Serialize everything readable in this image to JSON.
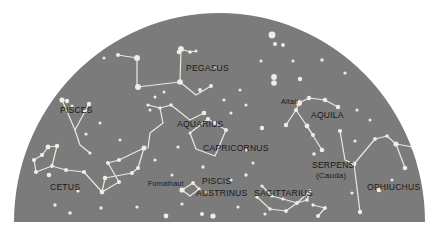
{
  "figure": {
    "kind": "star-chart",
    "projection": "half-dome horizon view",
    "background_color": "#ffffff",
    "sky_color": "#7b7b7b",
    "star_color": "#efeee4",
    "line_color": "#e8e7dd",
    "label_color": "#191919"
  },
  "dome": {
    "left": 14,
    "right": 425,
    "baseline": 222,
    "apex_y": 13
  },
  "chart_data": {
    "type": "scatter",
    "title": "",
    "xlabel": "",
    "ylabel": "",
    "constellation_labels": [
      {
        "name": "PEGASUS",
        "x": 186,
        "y": 71,
        "style": "constellation"
      },
      {
        "name": "PISCES",
        "x": 60,
        "y": 113,
        "style": "constellation"
      },
      {
        "name": "CETUS",
        "x": 50,
        "y": 190,
        "style": "constellation"
      },
      {
        "name": "AQUARIUS",
        "x": 177,
        "y": 127,
        "style": "constellation"
      },
      {
        "name": "CAPRICORNUS",
        "x": 203,
        "y": 151,
        "style": "constellation"
      },
      {
        "name": "PISCIS",
        "x": 202,
        "y": 184,
        "style": "constellation"
      },
      {
        "name": "AUSTRINUS",
        "x": 196,
        "y": 196,
        "style": "constellation"
      },
      {
        "name": "SAGITTARIUS",
        "x": 254,
        "y": 196,
        "style": "constellation"
      },
      {
        "name": "AQUILA",
        "x": 311,
        "y": 118,
        "style": "constellation"
      },
      {
        "name": "SERPENS",
        "x": 312,
        "y": 168,
        "style": "constellation"
      },
      {
        "name": "(Cauda)",
        "x": 316,
        "y": 178,
        "style": "sub"
      },
      {
        "name": "OPHIUCHUS",
        "x": 367,
        "y": 190,
        "style": "constellation"
      }
    ],
    "star_labels": [
      {
        "name": "Fomalhaut",
        "x": 148,
        "y": 186,
        "style": "star"
      },
      {
        "name": "Altair",
        "x": 281,
        "y": 104,
        "style": "star"
      }
    ],
    "stars": [
      {
        "x": 62,
        "y": 100,
        "r": 2.6
      },
      {
        "x": 67,
        "y": 101,
        "r": 2.2
      },
      {
        "x": 89,
        "y": 104,
        "r": 2.2
      },
      {
        "x": 85,
        "y": 111,
        "r": 1.9
      },
      {
        "x": 72,
        "y": 106,
        "r": 1.6
      },
      {
        "x": 118,
        "y": 55,
        "r": 2.1
      },
      {
        "x": 137,
        "y": 58,
        "r": 3.0
      },
      {
        "x": 179,
        "y": 52,
        "r": 2.3
      },
      {
        "x": 181,
        "y": 49,
        "r": 2.9
      },
      {
        "x": 190,
        "y": 52,
        "r": 1.8
      },
      {
        "x": 196,
        "y": 51,
        "r": 1.5
      },
      {
        "x": 138,
        "y": 87,
        "r": 3.0
      },
      {
        "x": 180,
        "y": 82,
        "r": 2.8
      },
      {
        "x": 200,
        "y": 90,
        "r": 1.9
      },
      {
        "x": 211,
        "y": 86,
        "r": 2.0
      },
      {
        "x": 224,
        "y": 100,
        "r": 1.6
      },
      {
        "x": 148,
        "y": 105,
        "r": 1.6
      },
      {
        "x": 160,
        "y": 108,
        "r": 1.7
      },
      {
        "x": 171,
        "y": 105,
        "r": 1.7
      },
      {
        "x": 204,
        "y": 113,
        "r": 2.3
      },
      {
        "x": 208,
        "y": 119,
        "r": 2.1
      },
      {
        "x": 215,
        "y": 123,
        "r": 2.1
      },
      {
        "x": 226,
        "y": 130,
        "r": 2.1
      },
      {
        "x": 262,
        "y": 128,
        "r": 2.2
      },
      {
        "x": 272,
        "y": 35,
        "r": 3.4
      },
      {
        "x": 275,
        "y": 44,
        "r": 2.0
      },
      {
        "x": 283,
        "y": 45,
        "r": 1.9
      },
      {
        "x": 274,
        "y": 77,
        "r": 2.9
      },
      {
        "x": 274,
        "y": 83,
        "r": 2.8
      },
      {
        "x": 300,
        "y": 79,
        "r": 2.2
      },
      {
        "x": 322,
        "y": 60,
        "r": 1.7
      },
      {
        "x": 345,
        "y": 73,
        "r": 1.6
      },
      {
        "x": 299,
        "y": 103,
        "r": 3.0
      },
      {
        "x": 309,
        "y": 98,
        "r": 2.2
      },
      {
        "x": 325,
        "y": 100,
        "r": 2.2
      },
      {
        "x": 338,
        "y": 107,
        "r": 2.2
      },
      {
        "x": 296,
        "y": 110,
        "r": 2.1
      },
      {
        "x": 286,
        "y": 125,
        "r": 2.2
      },
      {
        "x": 307,
        "y": 126,
        "r": 2.4
      },
      {
        "x": 313,
        "y": 135,
        "r": 2.0
      },
      {
        "x": 322,
        "y": 150,
        "r": 2.3
      },
      {
        "x": 314,
        "y": 154,
        "r": 1.8
      },
      {
        "x": 340,
        "y": 131,
        "r": 2.1
      },
      {
        "x": 354,
        "y": 164,
        "r": 2.4
      },
      {
        "x": 355,
        "y": 141,
        "r": 1.6
      },
      {
        "x": 375,
        "y": 139,
        "r": 1.9
      },
      {
        "x": 387,
        "y": 136,
        "r": 1.7
      },
      {
        "x": 396,
        "y": 144,
        "r": 2.6
      },
      {
        "x": 413,
        "y": 147,
        "r": 2.4
      },
      {
        "x": 405,
        "y": 168,
        "r": 2.3
      },
      {
        "x": 379,
        "y": 190,
        "r": 2.3
      },
      {
        "x": 360,
        "y": 212,
        "r": 2.2
      },
      {
        "x": 48,
        "y": 147,
        "r": 2.4
      },
      {
        "x": 57,
        "y": 146,
        "r": 2.2
      },
      {
        "x": 42,
        "y": 155,
        "r": 2.1
      },
      {
        "x": 34,
        "y": 160,
        "r": 2.1
      },
      {
        "x": 36,
        "y": 172,
        "r": 2.1
      },
      {
        "x": 49,
        "y": 175,
        "r": 2.3
      },
      {
        "x": 52,
        "y": 166,
        "r": 1.9
      },
      {
        "x": 66,
        "y": 170,
        "r": 2.1
      },
      {
        "x": 84,
        "y": 172,
        "r": 2.1
      },
      {
        "x": 105,
        "y": 178,
        "r": 2.2
      },
      {
        "x": 102,
        "y": 192,
        "r": 2.4
      },
      {
        "x": 119,
        "y": 182,
        "r": 2.0
      },
      {
        "x": 132,
        "y": 173,
        "r": 2.0
      },
      {
        "x": 108,
        "y": 163,
        "r": 2.0
      },
      {
        "x": 119,
        "y": 160,
        "r": 2.1
      },
      {
        "x": 144,
        "y": 148,
        "r": 2.5
      },
      {
        "x": 138,
        "y": 168,
        "r": 2.0
      },
      {
        "x": 86,
        "y": 134,
        "r": 1.6
      },
      {
        "x": 100,
        "y": 123,
        "r": 1.5
      },
      {
        "x": 150,
        "y": 110,
        "r": 1.5
      },
      {
        "x": 164,
        "y": 92,
        "r": 1.5
      },
      {
        "x": 178,
        "y": 147,
        "r": 1.6
      },
      {
        "x": 190,
        "y": 133,
        "r": 1.5
      },
      {
        "x": 203,
        "y": 167,
        "r": 1.7
      },
      {
        "x": 193,
        "y": 183,
        "r": 1.9
      },
      {
        "x": 199,
        "y": 189,
        "r": 1.8
      },
      {
        "x": 207,
        "y": 192,
        "r": 1.6
      },
      {
        "x": 182,
        "y": 190,
        "r": 2.6
      },
      {
        "x": 231,
        "y": 180,
        "r": 1.6
      },
      {
        "x": 246,
        "y": 175,
        "r": 1.7
      },
      {
        "x": 262,
        "y": 186,
        "r": 1.6
      },
      {
        "x": 257,
        "y": 197,
        "r": 1.7
      },
      {
        "x": 272,
        "y": 196,
        "r": 1.6
      },
      {
        "x": 283,
        "y": 199,
        "r": 1.6
      },
      {
        "x": 297,
        "y": 203,
        "r": 1.9
      },
      {
        "x": 307,
        "y": 200,
        "r": 1.8
      },
      {
        "x": 313,
        "y": 205,
        "r": 1.7
      },
      {
        "x": 325,
        "y": 208,
        "r": 1.9
      },
      {
        "x": 310,
        "y": 191,
        "r": 1.8
      },
      {
        "x": 286,
        "y": 211,
        "r": 1.9
      },
      {
        "x": 270,
        "y": 209,
        "r": 1.7
      },
      {
        "x": 318,
        "y": 216,
        "r": 2.0
      },
      {
        "x": 55,
        "y": 205,
        "r": 1.7
      },
      {
        "x": 70,
        "y": 213,
        "r": 1.8
      },
      {
        "x": 101,
        "y": 208,
        "r": 1.7
      },
      {
        "x": 137,
        "y": 207,
        "r": 1.6
      },
      {
        "x": 166,
        "y": 216,
        "r": 2.4
      },
      {
        "x": 202,
        "y": 214,
        "r": 2.0
      },
      {
        "x": 213,
        "y": 216,
        "r": 2.6
      },
      {
        "x": 182,
        "y": 204,
        "r": 1.6
      },
      {
        "x": 265,
        "y": 214,
        "r": 1.6
      },
      {
        "x": 238,
        "y": 207,
        "r": 1.6
      },
      {
        "x": 120,
        "y": 140,
        "r": 1.5
      },
      {
        "x": 155,
        "y": 160,
        "r": 1.6
      },
      {
        "x": 172,
        "y": 175,
        "r": 1.5
      },
      {
        "x": 246,
        "y": 150,
        "r": 1.5
      },
      {
        "x": 253,
        "y": 163,
        "r": 1.5
      },
      {
        "x": 231,
        "y": 113,
        "r": 1.5
      },
      {
        "x": 246,
        "y": 105,
        "r": 1.5
      },
      {
        "x": 357,
        "y": 110,
        "r": 1.6
      },
      {
        "x": 370,
        "y": 120,
        "r": 1.5
      },
      {
        "x": 400,
        "y": 113,
        "r": 1.6
      },
      {
        "x": 352,
        "y": 193,
        "r": 1.6
      },
      {
        "x": 392,
        "y": 180,
        "r": 1.5
      },
      {
        "x": 104,
        "y": 58,
        "r": 1.5
      },
      {
        "x": 155,
        "y": 97,
        "r": 1.5
      },
      {
        "x": 215,
        "y": 68,
        "r": 1.5
      },
      {
        "x": 240,
        "y": 90,
        "r": 1.5
      },
      {
        "x": 261,
        "y": 61,
        "r": 1.5
      },
      {
        "x": 293,
        "y": 61,
        "r": 1.5
      },
      {
        "x": 78,
        "y": 191,
        "r": 1.6
      },
      {
        "x": 90,
        "y": 153,
        "r": 1.6
      }
    ],
    "constellation_lines": [
      {
        "name": "pegasus",
        "points": [
          [
            118,
            55
          ],
          [
            137,
            58
          ],
          [
            137,
            87
          ],
          [
            180,
            82
          ],
          [
            181,
            49
          ],
          [
            179,
            52
          ]
        ]
      },
      {
        "name": "pegasus-neck",
        "points": [
          [
            180,
            82
          ],
          [
            196,
            95
          ],
          [
            211,
            86
          ]
        ]
      },
      {
        "name": "pegasus-head",
        "points": [
          [
            181,
            49
          ],
          [
            190,
            52
          ],
          [
            196,
            51
          ]
        ]
      },
      {
        "name": "pisces-v",
        "points": [
          [
            62,
            100
          ],
          [
            75,
            130
          ],
          [
            89,
            104
          ]
        ]
      },
      {
        "name": "pisces-tail",
        "points": [
          [
            75,
            130
          ],
          [
            80,
            145
          ],
          [
            90,
            153
          ]
        ]
      },
      {
        "name": "cetus-body",
        "points": [
          [
            34,
            160
          ],
          [
            42,
            155
          ],
          [
            48,
            147
          ],
          [
            57,
            146
          ],
          [
            52,
            166
          ],
          [
            36,
            172
          ],
          [
            34,
            160
          ]
        ]
      },
      {
        "name": "cetus-chain",
        "points": [
          [
            52,
            166
          ],
          [
            66,
            170
          ],
          [
            84,
            172
          ],
          [
            102,
            192
          ],
          [
            119,
            182
          ],
          [
            108,
            163
          ],
          [
            119,
            160
          ],
          [
            144,
            148
          ],
          [
            138,
            168
          ],
          [
            132,
            173
          ],
          [
            105,
            178
          ],
          [
            102,
            192
          ]
        ]
      },
      {
        "name": "aquarius-stream",
        "points": [
          [
            148,
            105
          ],
          [
            160,
            108
          ],
          [
            171,
            105
          ]
        ]
      },
      {
        "name": "aquarius-body",
        "points": [
          [
            160,
            108
          ],
          [
            163,
            123
          ],
          [
            150,
            133
          ],
          [
            148,
            148
          ]
        ]
      },
      {
        "name": "aquarius-arm",
        "points": [
          [
            171,
            105
          ],
          [
            190,
            120
          ],
          [
            204,
            113
          ]
        ]
      },
      {
        "name": "capricornus",
        "points": [
          [
            190,
            133
          ],
          [
            208,
            119
          ],
          [
            226,
            130
          ],
          [
            215,
            156
          ],
          [
            196,
            149
          ],
          [
            190,
            133
          ]
        ]
      },
      {
        "name": "piscis-austrinus",
        "points": [
          [
            182,
            190
          ],
          [
            193,
            183
          ],
          [
            199,
            189
          ],
          [
            190,
            196
          ],
          [
            182,
            190
          ]
        ]
      },
      {
        "name": "sagittarius-teapot",
        "points": [
          [
            262,
            186
          ],
          [
            272,
            196
          ],
          [
            283,
            199
          ],
          [
            297,
            203
          ],
          [
            307,
            200
          ],
          [
            310,
            191
          ],
          [
            297,
            203
          ]
        ]
      },
      {
        "name": "sagittarius-handle",
        "points": [
          [
            257,
            197
          ],
          [
            270,
            209
          ],
          [
            286,
            211
          ],
          [
            297,
            203
          ]
        ]
      },
      {
        "name": "sagittarius-spout",
        "points": [
          [
            313,
            205
          ],
          [
            325,
            208
          ],
          [
            318,
            216
          ]
        ]
      },
      {
        "name": "aquila",
        "points": [
          [
            296,
            110
          ],
          [
            299,
            103
          ],
          [
            309,
            98
          ],
          [
            325,
            100
          ],
          [
            338,
            107
          ]
        ]
      },
      {
        "name": "aquila-body",
        "points": [
          [
            286,
            125
          ],
          [
            296,
            110
          ],
          [
            307,
            126
          ],
          [
            313,
            135
          ]
        ]
      },
      {
        "name": "aquila-tail",
        "points": [
          [
            307,
            126
          ],
          [
            322,
            150
          ]
        ]
      },
      {
        "name": "serpens-cauda",
        "points": [
          [
            340,
            131
          ],
          [
            345,
            160
          ],
          [
            354,
            164
          ]
        ]
      },
      {
        "name": "ophiuchus",
        "points": [
          [
            354,
            164
          ],
          [
            375,
            139
          ],
          [
            387,
            136
          ],
          [
            396,
            144
          ],
          [
            413,
            147
          ]
        ]
      },
      {
        "name": "ophiuchus-leg",
        "points": [
          [
            354,
            164
          ],
          [
            360,
            212
          ]
        ]
      },
      {
        "name": "ophiuchus-arm",
        "points": [
          [
            396,
            144
          ],
          [
            405,
            168
          ]
        ]
      }
    ]
  }
}
